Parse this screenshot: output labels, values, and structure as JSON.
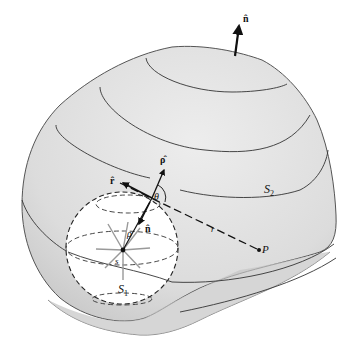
{
  "figure": {
    "type": "3D surface diagram — closed surface with spherical cavity around a source point",
    "colors": {
      "surface_fill": "#dedede",
      "surface_outline": "#555555",
      "sphere_fill": "#ffffff",
      "ink": "#111111",
      "source_rays": "#9a9a9a"
    },
    "labels": {
      "outer_normal": "n̂",
      "inner_normal": "n̂",
      "rho_hat": "ρ̂",
      "r_hat": "r̂",
      "theta": "θ",
      "rho": "ρ",
      "source": "s",
      "r": "r",
      "point": "P",
      "surface_outer": "S",
      "surface_outer_sub": "2",
      "surface_inner": "S",
      "surface_inner_sub": "1"
    }
  }
}
